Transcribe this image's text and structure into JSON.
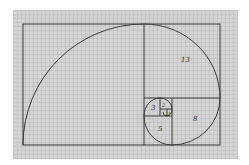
{
  "diagram": {
    "labels": [
      {
        "text": "13",
        "x": 181,
        "y": 62
      },
      {
        "text": "8",
        "x": 193,
        "y": 121
      },
      {
        "text": "5",
        "x": 158,
        "y": 131
      },
      {
        "text": "3",
        "x": 151,
        "y": 110
      },
      {
        "text": "2",
        "x": 162,
        "y": 108
      },
      {
        "text": "1",
        "x": 166,
        "y": 114
      }
    ],
    "colors": {
      "line": "#3a3a3a",
      "paper": "#d4d4d4",
      "grid": "#c6c6c6"
    }
  }
}
